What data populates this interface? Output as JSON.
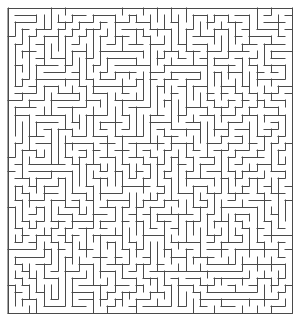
{
  "figure": {
    "kind": "maze-puzzle",
    "title": "Rectangular perfect maze",
    "width_px": 301,
    "height_px": 319,
    "background_color": "#ffffff"
  },
  "maze": {
    "columns": 40,
    "rows": 43,
    "cell_size_px": 7.1,
    "origin_x_px": 8,
    "origin_y_px": 8,
    "grid_width_px": 284,
    "grid_height_px": 305,
    "wall_color": "#4a4a4a",
    "wall_thickness_px": 1,
    "border_color": "#4a4a4a",
    "border_thickness_px": 1,
    "passage_color": "#ffffff",
    "style": "perfect-maze-spanning-tree",
    "closed_border": true,
    "seed": 20240617
  }
}
